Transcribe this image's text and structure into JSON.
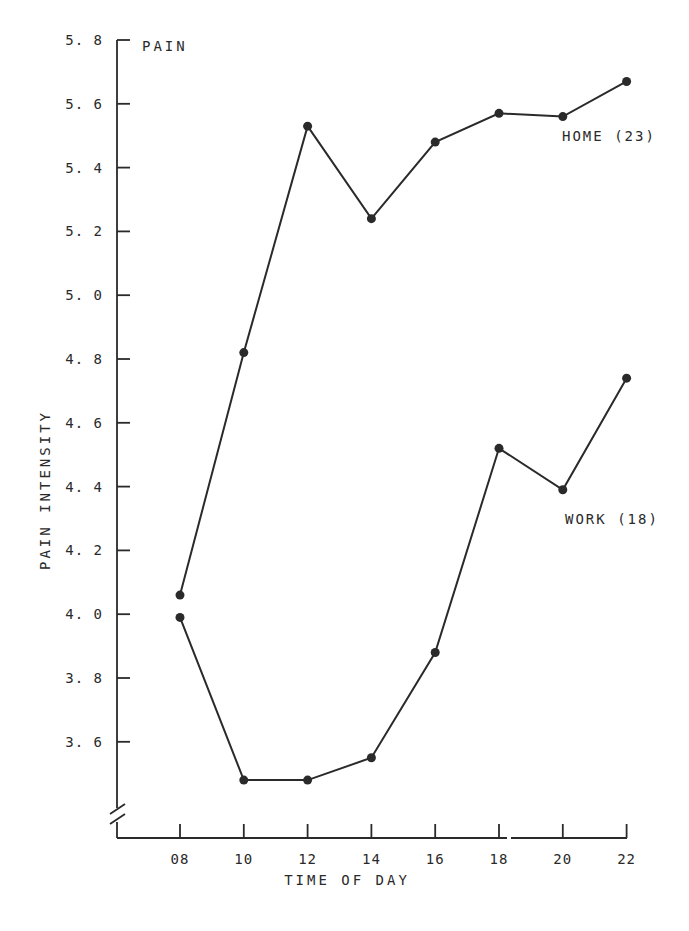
{
  "chart_data": {
    "type": "line",
    "title": "",
    "xlabel": "TIME OF DAY",
    "ylabel": "PAIN INTENSITY",
    "y_axis_top_label": "PAIN",
    "categories": [
      "08",
      "10",
      "12",
      "14",
      "16",
      "18",
      "20",
      "22"
    ],
    "x": [
      8,
      10,
      12,
      14,
      16,
      18,
      20,
      22
    ],
    "yticks": [
      5.8,
      5.6,
      5.4,
      5.2,
      5.0,
      4.8,
      4.6,
      4.4,
      4.2,
      4.0,
      3.8,
      3.6
    ],
    "ytick_labels": [
      "5.8",
      "5.6",
      "5.4",
      "5.2",
      "5.0",
      "4.8",
      "4.6",
      "4.4",
      "4.2",
      "4.0",
      "3.8",
      "3.6"
    ],
    "ylim": [
      3.4,
      5.8
    ],
    "axis_break": true,
    "grid": false,
    "legend_position": "inline labels at right",
    "series": [
      {
        "name": "HOME (23)",
        "values": [
          4.06,
          4.82,
          5.53,
          5.24,
          5.48,
          5.57,
          5.56,
          5.67
        ]
      },
      {
        "name": "WORK (18)",
        "values": [
          3.99,
          3.48,
          3.48,
          3.55,
          3.88,
          4.52,
          4.39,
          4.74
        ]
      }
    ]
  },
  "labels": {
    "pain": "PAIN",
    "y_axis_title": "PAIN INTENSITY",
    "x_axis_title": "TIME OF DAY",
    "home_series": "HOME (23)",
    "work_series": "WORK (18)"
  }
}
